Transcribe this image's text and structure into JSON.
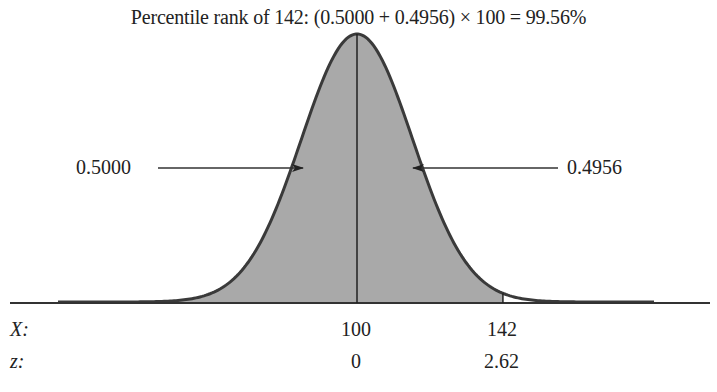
{
  "chart_data": {
    "type": "area",
    "title": "Percentile rank of 142: (0.5000 + 0.4956) × 100 = 99.56%",
    "distribution": "normal",
    "mean": 100,
    "x_value": 142,
    "z_value": 2.62,
    "areas": [
      {
        "name": "left of mean",
        "value": "0.5000"
      },
      {
        "name": "mean to 142",
        "value": "0.4956"
      }
    ],
    "percentile_rank": "99.56%",
    "shaded_region": "z ≤ 2.62",
    "axis_rows": [
      {
        "label": "X:",
        "ticks": [
          "100",
          "142"
        ]
      },
      {
        "label": "z:",
        "ticks": [
          "0",
          "2.62"
        ]
      }
    ]
  },
  "labels": {
    "left_area": "0.5000",
    "right_area": "0.4956",
    "x_row": "X:",
    "z_row": "z:",
    "x_mean": "100",
    "x_value": "142",
    "z_mean": "0",
    "z_value": "2.62"
  },
  "colors": {
    "shade": "#a9a9a9",
    "curve": "#3a3a3a",
    "axis": "#333333"
  }
}
